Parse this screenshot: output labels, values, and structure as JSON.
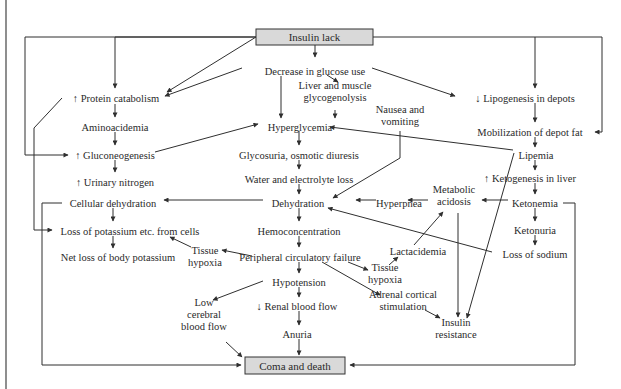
{
  "diagram": {
    "colors": {
      "line": "#2f2f2f",
      "text": "#2a2a2a",
      "box_fill": "#d9d9d9",
      "background": "#ffffff"
    },
    "boxed_nodes": [
      {
        "id": "insulin_lack",
        "label": "Insulin lack",
        "x": 256,
        "y": 29,
        "w": 117,
        "h": 16
      },
      {
        "id": "coma_death",
        "label": "Coma and death",
        "x": 245,
        "y": 357,
        "w": 100,
        "h": 17
      }
    ],
    "nodes": [
      {
        "id": "decrease_glucose",
        "lines": [
          "Decrease in glucose use"
        ],
        "x": 315,
        "y": 71
      },
      {
        "id": "liver_glyco",
        "lines": [
          "Liver and muscle",
          "glycogenolysis"
        ],
        "x": 335,
        "y": 91
      },
      {
        "id": "protein_catabolism",
        "lines": [
          "↑ Protein catabolism"
        ],
        "x": 116,
        "y": 98
      },
      {
        "id": "aminoacidemia",
        "lines": [
          "Aminoacidemia"
        ],
        "x": 115,
        "y": 127
      },
      {
        "id": "hyperglycemia",
        "lines": [
          "Hyperglycemia"
        ],
        "x": 300,
        "y": 127
      },
      {
        "id": "nausea",
        "lines": [
          "Nausea and",
          "vomiting"
        ],
        "x": 400,
        "y": 115
      },
      {
        "id": "lipogenesis",
        "lines": [
          "↓ Lipogenesis in depots"
        ],
        "x": 525,
        "y": 98
      },
      {
        "id": "mobilization",
        "lines": [
          "Mobilization of depot fat"
        ],
        "x": 530,
        "y": 132
      },
      {
        "id": "gluconeogenesis",
        "lines": [
          "↑ Gluconeogenesis"
        ],
        "x": 115,
        "y": 155
      },
      {
        "id": "glycosuria",
        "lines": [
          "Glycosuria, osmotic diuresis"
        ],
        "x": 299,
        "y": 155
      },
      {
        "id": "lipemia",
        "lines": [
          "Lipemia"
        ],
        "x": 536,
        "y": 155
      },
      {
        "id": "urinary_nitrogen",
        "lines": [
          "↑ Urinary nitrogen"
        ],
        "x": 115,
        "y": 182
      },
      {
        "id": "water_loss",
        "lines": [
          "Water and electrolyte loss"
        ],
        "x": 299,
        "y": 179
      },
      {
        "id": "ketogenesis",
        "lines": [
          "↑ Ketogenesis in liver"
        ],
        "x": 530,
        "y": 178
      },
      {
        "id": "cellular_dehydration",
        "lines": [
          "Cellular dehydration"
        ],
        "x": 113,
        "y": 203
      },
      {
        "id": "dehydration",
        "lines": [
          "Dehydration"
        ],
        "x": 298,
        "y": 203
      },
      {
        "id": "hyperpnea",
        "lines": [
          "Hyperpnea"
        ],
        "x": 399,
        "y": 203
      },
      {
        "id": "metabolic_acidosis",
        "lines": [
          "Metabolic",
          "acidosis"
        ],
        "x": 454,
        "y": 195
      },
      {
        "id": "ketonemia",
        "lines": [
          "Ketonemia"
        ],
        "x": 535,
        "y": 203
      },
      {
        "id": "loss_potassium",
        "lines": [
          "Loss of potassium etc. from cells"
        ],
        "x": 130,
        "y": 231
      },
      {
        "id": "hemoconcentration",
        "lines": [
          "Hemoconcentration"
        ],
        "x": 299,
        "y": 231
      },
      {
        "id": "ketonuria",
        "lines": [
          "Ketonuria"
        ],
        "x": 535,
        "y": 230
      },
      {
        "id": "tissue_hypoxia_left",
        "lines": [
          "Tissue",
          "hypoxia"
        ],
        "x": 205,
        "y": 256
      },
      {
        "id": "peripheral_failure",
        "lines": [
          "Peripheral circulatory failure"
        ],
        "x": 300,
        "y": 257
      },
      {
        "id": "lactacidemia",
        "lines": [
          "Lactacidemia"
        ],
        "x": 418,
        "y": 251
      },
      {
        "id": "loss_sodium",
        "lines": [
          "Loss of sodium"
        ],
        "x": 535,
        "y": 254
      },
      {
        "id": "net_loss_potassium",
        "lines": [
          "Net loss of body potassium"
        ],
        "x": 118,
        "y": 257
      },
      {
        "id": "tissue_hypoxia_right",
        "lines": [
          "Tissue",
          "hypoxia"
        ],
        "x": 385,
        "y": 273
      },
      {
        "id": "hypotension",
        "lines": [
          "Hypotension"
        ],
        "x": 299,
        "y": 282
      },
      {
        "id": "adrenal",
        "lines": [
          "Adrenal cortical",
          "stimulation"
        ],
        "x": 403,
        "y": 300
      },
      {
        "id": "low_cerebral",
        "lines": [
          "Low",
          "cerebral",
          "blood flow"
        ],
        "x": 204,
        "y": 314
      },
      {
        "id": "renal_flow",
        "lines": [
          "↓ Renal blood flow"
        ],
        "x": 297,
        "y": 306
      },
      {
        "id": "anuria",
        "lines": [
          "Anuria"
        ],
        "x": 297,
        "y": 334
      },
      {
        "id": "insulin_resistance",
        "lines": [
          "Insulin",
          "resistance"
        ],
        "x": 456,
        "y": 328
      }
    ],
    "edges": [
      {
        "d": "M315,45 L315,57",
        "arrow": true
      },
      {
        "d": "M256,37 L167,92",
        "arrow": true
      },
      {
        "d": "M242,68 L165,96",
        "arrow": true
      },
      {
        "d": "M256,37 L115,37 L115,88",
        "arrow": true
      },
      {
        "d": "M256,37 L25,37 L25,155 L68,155",
        "arrow": true
      },
      {
        "d": "M373,37 L602,37 L602,132 L595,132",
        "arrow": true
      },
      {
        "d": "M535,37 L535,88",
        "arrow": true
      },
      {
        "d": "M372,68 L455,96",
        "arrow": true
      },
      {
        "d": "M281,76 L281,118",
        "arrow": true
      },
      {
        "d": "M327,75 L338,82",
        "arrow": true
      },
      {
        "d": "M335,110 L335,118",
        "arrow": true
      },
      {
        "d": "M115,104 L115,117",
        "arrow": true
      },
      {
        "d": "M115,132 L115,145",
        "arrow": true
      },
      {
        "d": "M115,160 L115,172",
        "arrow": true
      },
      {
        "d": "M155,152 L258,124",
        "arrow": true
      },
      {
        "d": "M299,131 L299,145",
        "arrow": true
      },
      {
        "d": "M299,160 L299,169",
        "arrow": true
      },
      {
        "d": "M299,184 L299,194",
        "arrow": true
      },
      {
        "d": "M299,208 L299,221",
        "arrow": true
      },
      {
        "d": "M299,236 L299,247",
        "arrow": true
      },
      {
        "d": "M299,262 L299,273",
        "arrow": true
      },
      {
        "d": "M299,287 L299,297",
        "arrow": true
      },
      {
        "d": "M299,311 L299,325",
        "arrow": true
      },
      {
        "d": "M299,339 L299,355",
        "arrow": true
      },
      {
        "d": "M400,131 L400,158 L333,198",
        "arrow": true
      },
      {
        "d": "M513,150 L330,127",
        "arrow": true
      },
      {
        "d": "M535,103 L535,122",
        "arrow": true
      },
      {
        "d": "M535,137 L535,147",
        "arrow": true
      },
      {
        "d": "M535,160 L535,170",
        "arrow": true
      },
      {
        "d": "M535,183 L535,194",
        "arrow": true
      },
      {
        "d": "M535,208 L535,221",
        "arrow": true
      },
      {
        "d": "M535,235 L535,245",
        "arrow": true
      },
      {
        "d": "M508,200 L482,200",
        "arrow": true
      },
      {
        "d": "M428,200 L408,200",
        "arrow": true
      },
      {
        "d": "M376,200 L356,200",
        "arrow": true
      },
      {
        "d": "M263,200 L164,200",
        "arrow": true
      },
      {
        "d": "M113,208 L113,221",
        "arrow": true
      },
      {
        "d": "M113,236 L113,248",
        "arrow": true
      },
      {
        "d": "M492,252 L328,208",
        "arrow": true
      },
      {
        "d": "M563,203 L575,203 L575,365 L350,365",
        "arrow": true
      },
      {
        "d": "M62,203 L42,203 L42,365 L241,365",
        "arrow": true
      },
      {
        "d": "M62,98 L34,128 L34,230 L52,230",
        "arrow": true
      },
      {
        "d": "M252,256 L222,250",
        "arrow": true
      },
      {
        "d": "M191,247 L170,237",
        "arrow": true
      },
      {
        "d": "M348,262 L368,270",
        "arrow": true
      },
      {
        "d": "M322,262 L380,295",
        "arrow": true
      },
      {
        "d": "M414,245 L443,212",
        "arrow": true
      },
      {
        "d": "M389,265 L398,257",
        "arrow": true
      },
      {
        "d": "M263,281 L213,300",
        "arrow": true
      },
      {
        "d": "M226,342 L242,357",
        "arrow": true
      },
      {
        "d": "M425,310 L440,318",
        "arrow": true
      },
      {
        "d": "M458,213 L458,317",
        "arrow": true
      },
      {
        "d": "M514,153 L467,318",
        "arrow": true
      }
    ]
  }
}
